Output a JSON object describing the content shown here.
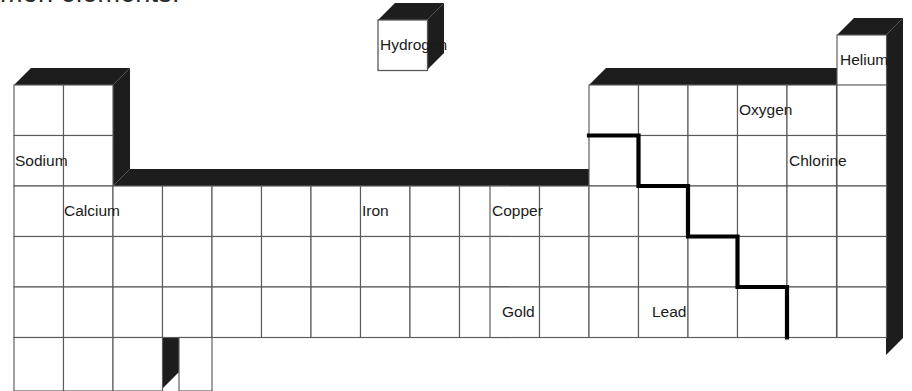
{
  "page": {
    "title_text": "mon elements.",
    "title_note": "partially cropped heading at top edge"
  },
  "diagram": {
    "name": "periodic-table-3d",
    "kind": "periodic table outline, isometric / extruded style",
    "columns": 18,
    "rows": 7,
    "colors": {
      "cell_fill": "#ffffff",
      "cell_stroke": "#5a5a5a",
      "extrusion": "#1d1d1d",
      "staircase_line": "#000000",
      "title_text": "#2b2b2b"
    },
    "geometry": {
      "origin_x": 14,
      "origin_y": 85,
      "col_width": 49.5,
      "row_height": 50.5,
      "depth_x": 17,
      "depth_y": -17
    },
    "labels": [
      {
        "name": "hydrogen",
        "text": "Hydrogen",
        "col": 1,
        "row": 1,
        "detached": true
      },
      {
        "name": "helium",
        "text": "Helium",
        "col": 18,
        "row": 1,
        "raised": true
      },
      {
        "name": "sodium",
        "text": "Sodium",
        "col": 1,
        "row": 3
      },
      {
        "name": "calcium",
        "text": "Calcium",
        "col": 2,
        "row": 4
      },
      {
        "name": "iron",
        "text": "Iron",
        "col": 8,
        "row": 4
      },
      {
        "name": "copper",
        "text": "Copper",
        "col": 11,
        "row": 4
      },
      {
        "name": "oxygen",
        "text": "Oxygen",
        "col": 16,
        "row": 2
      },
      {
        "name": "chlorine",
        "text": "Chlorine",
        "col": 17,
        "row": 3
      },
      {
        "name": "gold",
        "text": "Gold",
        "col": 11,
        "row": 6
      },
      {
        "name": "lead",
        "text": "Lead",
        "col": 14,
        "row": 6
      }
    ],
    "block_description": {
      "row1": "columns 1 and 18 only (Hydrogen drawn as separate floating cube, Helium raised)",
      "row2": "columns 1-2 and 13-18",
      "row3": "columns 1-2 and 13-18",
      "row4": "columns 1-18 full width",
      "row5": "columns 1-18 full width",
      "row6": "columns 1-18 full width",
      "row7": "columns 1-4 partial strip"
    },
    "staircase": {
      "name": "metal-nonmetal-divider",
      "description": "bold stepped line descending from column 13/14 boundary rightwards",
      "steps": [
        {
          "row": 2,
          "col_right_of": 13
        },
        {
          "row": 3,
          "col_right_of": 14
        },
        {
          "row": 4,
          "col_right_of": 15
        },
        {
          "row": 5,
          "col_right_of": 16
        },
        {
          "row": 6,
          "col_right_of": 16
        }
      ]
    }
  }
}
